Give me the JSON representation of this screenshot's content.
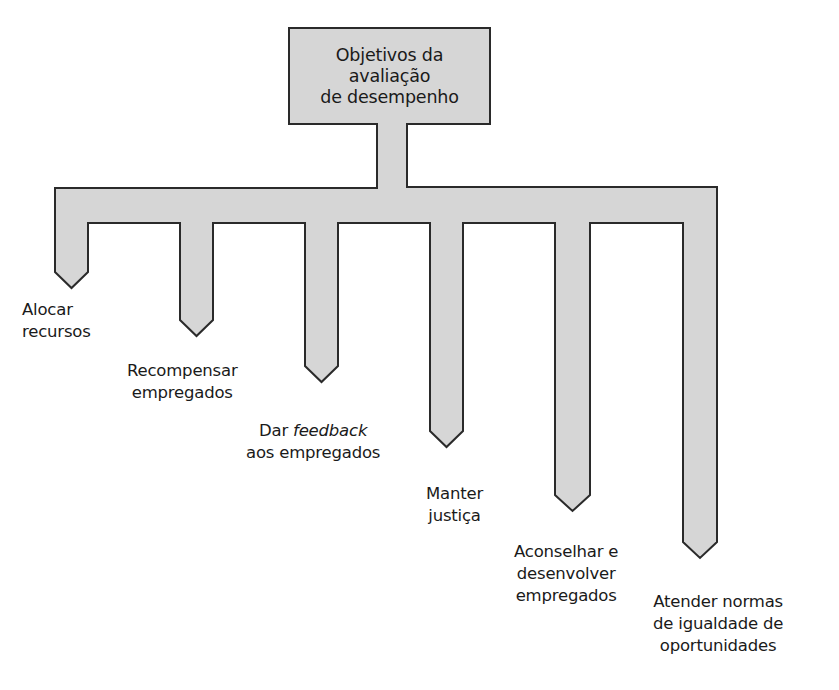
{
  "diagram": {
    "title_lines": [
      "Objetivos da",
      "avaliação",
      "de desempenho"
    ],
    "fill_color": "#d6d6d6",
    "stroke_color": "#2a2a2a",
    "branches": [
      {
        "lines": [
          "Alocar",
          "recursos"
        ]
      },
      {
        "lines": [
          "Recompensar",
          "empregados"
        ]
      },
      {
        "line1_prefix": "Dar ",
        "line1_emphasis": "feedback",
        "lines": [
          "",
          "aos empregados"
        ]
      },
      {
        "lines": [
          "Manter",
          "justiça"
        ]
      },
      {
        "lines": [
          "Aconselhar e",
          "desenvolver",
          "empregados"
        ]
      },
      {
        "lines": [
          "Atender normas",
          "de igualdade de",
          "oportunidades"
        ]
      }
    ]
  }
}
